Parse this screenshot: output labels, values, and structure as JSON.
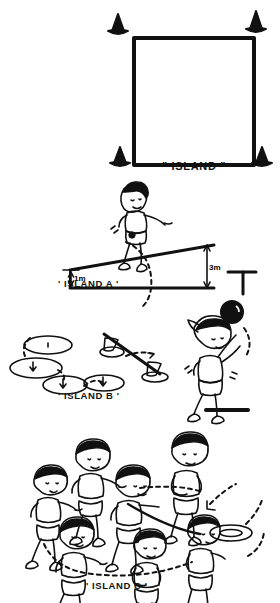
{
  "document": {
    "kind": "hand-drawn physical education activity diagram",
    "background_color": "#ffffff",
    "ink_color": "#111111",
    "orientation": "portrait"
  },
  "panels": [
    {
      "id": "island-main",
      "caption": "\" ISLAND \"",
      "equipment": "four traffic cones marking a square court",
      "cone_count": 4
    },
    {
      "id": "island-a",
      "caption": "' ISLAND A '",
      "equipment": "inclined ramp / springboard with suspended ball",
      "dim_low_label": "1m",
      "dim_high_label": "3m",
      "children_count": 1
    },
    {
      "id": "island-b",
      "caption": "' ISLAND B '",
      "equipment": "hoops on floor, two cones on a sloped beam, suspended ball",
      "hoop_count": 4,
      "cone_count": 2,
      "children_count": 1
    },
    {
      "id": "island-c",
      "caption": "' ISLAND C '",
      "equipment": "circle of children passing a ring / quoit",
      "children_count": 6,
      "ring_count": 1
    }
  ],
  "labels": {
    "island_main": "\" ISLAND \"",
    "island_a": "' ISLAND A '",
    "island_b": "' ISLAND B '",
    "island_c": "' ISLAND C '",
    "dim_1m": "1m",
    "dim_3m": "3m"
  },
  "icons": {
    "cone": "cone-icon",
    "hoop": "hoop-icon",
    "ball": "ball-icon",
    "ring": "ring-icon",
    "child": "child-figure-icon",
    "arrow": "arrow-icon"
  }
}
